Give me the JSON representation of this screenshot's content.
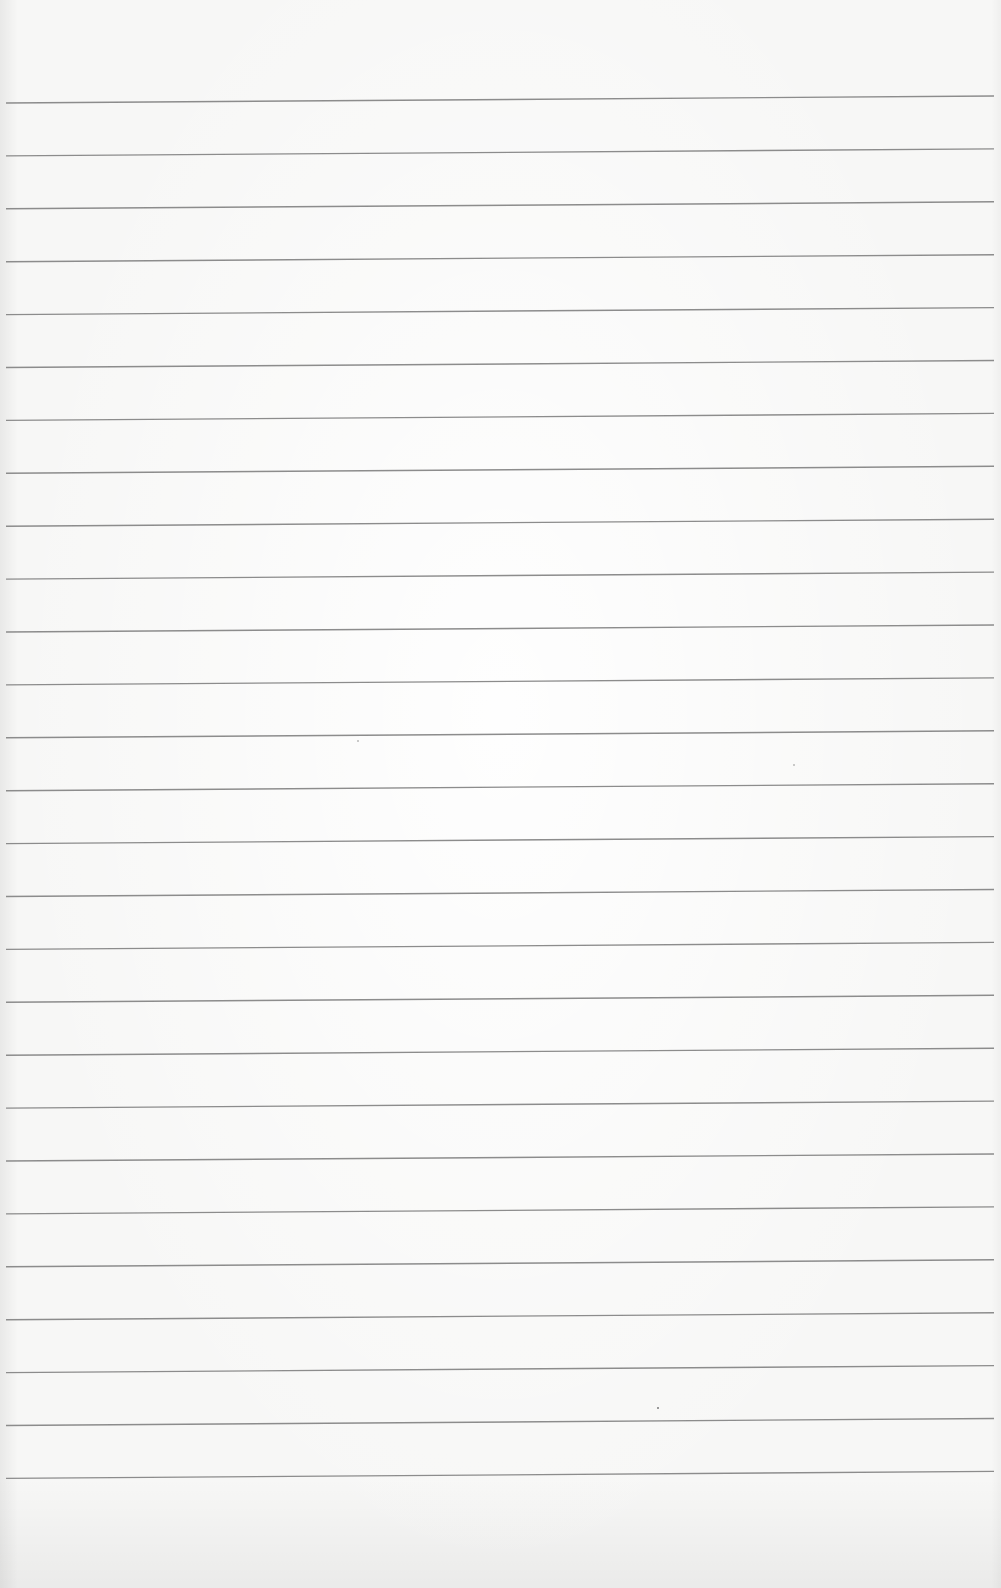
{
  "page": {
    "type": "ruled-paper-sheet",
    "background_color": "#f7f7f6",
    "rule_color": "#8c8c8c",
    "rule_thickness_px": 1.4
  },
  "rules": {
    "count": 27,
    "x_start": 6,
    "x_end": 994,
    "first_y_left": 103,
    "first_y_right": 96,
    "spacing": 52.9
  }
}
